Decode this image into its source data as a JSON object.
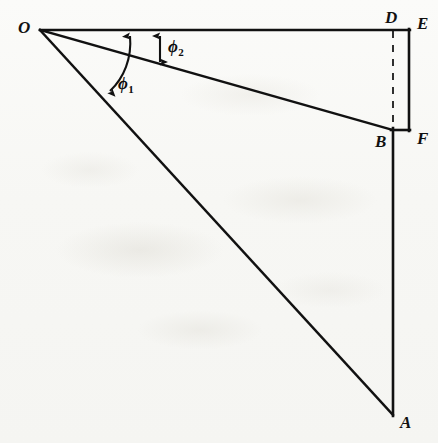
{
  "figure": {
    "kind": "geometry-diagram",
    "background_color": "#f8f8f6",
    "ink_color": "#111111"
  },
  "points": [
    {
      "id": "O",
      "label": "O",
      "x": 40,
      "y": 30,
      "label_x": 18,
      "label_y": 19
    },
    {
      "id": "D",
      "label": "D",
      "x": 393,
      "y": 30,
      "label_x": 385,
      "label_y": 9
    },
    {
      "id": "E",
      "label": "E",
      "x": 409,
      "y": 30,
      "label_x": 417,
      "label_y": 15
    },
    {
      "id": "B",
      "label": "B",
      "x": 393,
      "y": 130,
      "label_x": 375,
      "label_y": 133
    },
    {
      "id": "F",
      "label": "F",
      "x": 409,
      "y": 130,
      "label_x": 417,
      "label_y": 130
    },
    {
      "id": "A",
      "label": "A",
      "x": 393,
      "y": 415,
      "label_x": 400,
      "label_y": 414
    }
  ],
  "segments": [
    {
      "id": "OE",
      "from": "O",
      "to": "E",
      "style": "solid",
      "note": "horizontal reference line"
    },
    {
      "id": "OB",
      "from": "O",
      "to": "B",
      "style": "solid",
      "note": "ray to B"
    },
    {
      "id": "OA",
      "from": "O",
      "to": "A",
      "style": "solid",
      "note": "ray to A"
    },
    {
      "id": "EF",
      "from": "E",
      "to": "F",
      "style": "solid",
      "note": "right vertical side"
    },
    {
      "id": "BF",
      "from": "B",
      "to": "F",
      "style": "solid",
      "note": "short horizontal at B"
    },
    {
      "id": "BA",
      "from": "B",
      "to": "A",
      "style": "solid",
      "note": "long vertical down to A"
    },
    {
      "id": "DB",
      "from": "D",
      "to": "B",
      "style": "dashed",
      "note": "dashed vertical"
    }
  ],
  "angles": [
    {
      "id": "phi1",
      "label": "ϕ",
      "subscript": "1",
      "label_x": 118,
      "label_y": 75,
      "marker": "curved-double-arrow",
      "between": [
        "OE",
        "OA"
      ]
    },
    {
      "id": "phi2",
      "label": "ϕ",
      "subscript": "2",
      "label_x": 168,
      "label_y": 38,
      "marker": "straight-double-arrow",
      "between": [
        "OE",
        "OB"
      ]
    }
  ]
}
